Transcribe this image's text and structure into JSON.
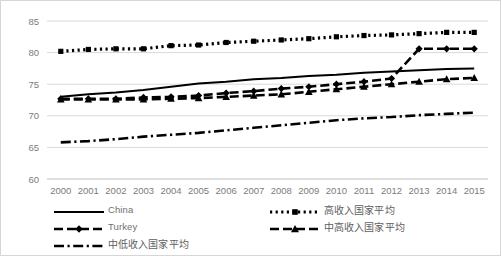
{
  "chart_data": {
    "type": "line",
    "title": "",
    "xlabel": "",
    "ylabel": "",
    "x": [
      2000,
      2001,
      2002,
      2003,
      2004,
      2005,
      2006,
      2007,
      2008,
      2009,
      2010,
      2011,
      2012,
      2013,
      2014,
      2015
    ],
    "xtick_labels": [
      "2000",
      "2001",
      "2002",
      "2003",
      "2004",
      "2005",
      "2006",
      "2007",
      "2008",
      "2009",
      "2010",
      "2011",
      "2012",
      "2013",
      "2014",
      "2015"
    ],
    "ylim": [
      60,
      85
    ],
    "ytick_labels": [
      "60",
      "65",
      "70",
      "75",
      "80",
      "85"
    ],
    "yticks": [
      60,
      65,
      70,
      75,
      80,
      85
    ],
    "grid": true,
    "legend_position": "bottom",
    "series": [
      {
        "name": "China",
        "style": "solid",
        "marker": "none",
        "values": [
          73.0,
          73.4,
          73.7,
          74.1,
          74.6,
          75.1,
          75.4,
          75.8,
          76.0,
          76.3,
          76.5,
          76.8,
          77.0,
          77.2,
          77.4,
          77.5
        ]
      },
      {
        "name": "Turkey",
        "style": "dashed",
        "marker": "diamond",
        "values": [
          72.7,
          72.7,
          72.7,
          72.9,
          73.0,
          73.2,
          73.6,
          73.9,
          74.3,
          74.6,
          75.0,
          75.4,
          75.9,
          80.6,
          80.6,
          80.6
        ]
      },
      {
        "name": "中低收入国家平均",
        "style": "dash-dot",
        "marker": "none",
        "values": [
          65.8,
          66.0,
          66.3,
          66.7,
          67.0,
          67.3,
          67.7,
          68.1,
          68.5,
          68.9,
          69.3,
          69.6,
          69.8,
          70.1,
          70.3,
          70.5
        ]
      },
      {
        "name": "高收入国家平均",
        "style": "dotted",
        "marker": "square",
        "values": [
          80.2,
          80.5,
          80.6,
          80.6,
          81.1,
          81.2,
          81.6,
          81.8,
          82.0,
          82.2,
          82.5,
          82.7,
          82.8,
          83.0,
          83.2,
          83.2
        ]
      },
      {
        "name": "中高收入国家平均",
        "style": "dashed",
        "marker": "triangle",
        "values": [
          72.6,
          72.6,
          72.6,
          72.6,
          72.7,
          72.8,
          73.0,
          73.2,
          73.4,
          73.8,
          74.2,
          74.6,
          75.0,
          75.4,
          75.8,
          76.0
        ]
      }
    ]
  },
  "legend": {
    "left_column": [
      {
        "label": "China",
        "swatch": "solid-line-swatch"
      },
      {
        "label": "Turkey",
        "swatch": "dashed-diamond-swatch"
      },
      {
        "label": "中低收入国家平均",
        "swatch": "dash-dot-swatch"
      }
    ],
    "right_column": [
      {
        "label": "高收入国家平均",
        "swatch": "dotted-square-swatch"
      },
      {
        "label": "中高收入国家平均",
        "swatch": "dashed-triangle-swatch"
      }
    ]
  },
  "colors": {
    "series": "#000000",
    "gridline": "#d9d9d9",
    "tick_text": "#7b7b7b",
    "border": "#d6d6d6",
    "background": "#ffffff"
  }
}
